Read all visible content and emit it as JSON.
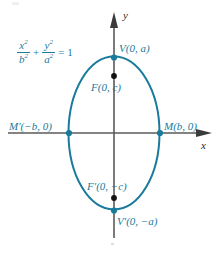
{
  "figure": {
    "colors": {
      "curve": "#1a7a9c",
      "label_text": "#1a7a9c",
      "axis": "#5a5a5a",
      "axis_label_text": "#2b2b2b",
      "focus_dot": "#111111",
      "vertex_dot": "#1a7a9c",
      "background": "#ffffff"
    },
    "axes": {
      "x_label": "x",
      "y_label": "y",
      "center": {
        "x": 114,
        "y": 133
      }
    },
    "equation": {
      "term1_num": "x",
      "term1_num_exp": "2",
      "term1_den": "b",
      "term1_den_exp": "2",
      "plus": "+",
      "term2_num": "y",
      "term2_num_exp": "2",
      "term2_den": "a",
      "term2_den_exp": "2",
      "equals": "= 1"
    },
    "ellipse": {
      "center_x": 114,
      "center_y": 133,
      "semi_minor_b": 45,
      "semi_major_a": 76
    },
    "points": [
      {
        "id": "vertex-top",
        "label": "V(0, a)",
        "x": 114,
        "y": 58,
        "dot": "vertex"
      },
      {
        "id": "focus-top",
        "label": "F(0, c)",
        "x": 114,
        "y": 76,
        "dot": "focus"
      },
      {
        "id": "covertex-left",
        "label": "M′(−b, 0)",
        "x": 69,
        "y": 133,
        "dot": "vertex"
      },
      {
        "id": "covertex-right",
        "label": "M(b, 0)",
        "x": 160,
        "y": 133,
        "dot": "vertex"
      },
      {
        "id": "focus-bottom",
        "label": "F′(0, −c)",
        "x": 114,
        "y": 198,
        "dot": "focus"
      },
      {
        "id": "vertex-bottom",
        "label": "V′(0, −a)",
        "x": 114,
        "y": 211,
        "dot": "vertex"
      }
    ],
    "labels": {
      "vertex_top": "V(0, a)",
      "focus_top": "F(0, c)",
      "covertex_left": "M′(−b, 0)",
      "covertex_right": "M(b, 0)",
      "focus_bottom": "F′(0, −c)",
      "vertex_bottom": "V′(0, −a)"
    }
  }
}
